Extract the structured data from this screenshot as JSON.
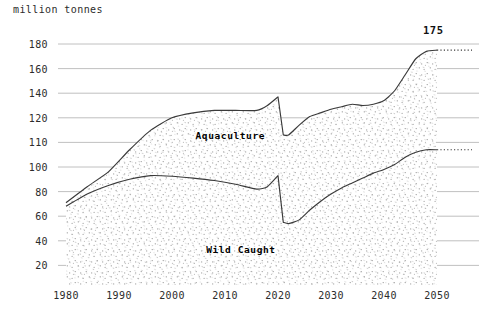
{
  "axis_unit_label": "million tonnes",
  "peak_annotation": "175",
  "series_labels": {
    "aquaculture": "Aquaculture",
    "wild_caught": "Wild Caught"
  },
  "colors": {
    "line": "#3a3a3a",
    "gridline": "#b9b9b9",
    "stipple": "#8d8d8d",
    "text": "#2b2b2b",
    "background": "#ffffff"
  },
  "chart_data": {
    "type": "area",
    "title": "",
    "subtitle": "",
    "xlabel": "",
    "ylabel": "million tonnes",
    "stacked": true,
    "grid": true,
    "legend_position": "inline",
    "annotations": [
      {
        "text": "175",
        "x": 2050,
        "y": 175,
        "note": "projected total production in 2050"
      }
    ],
    "xlim": [
      1978,
      2057
    ],
    "x_ticks": [
      1980,
      1990,
      2000,
      2010,
      2020,
      2030,
      2040,
      2050
    ],
    "x_tick_labels": [
      "1980",
      "1990",
      "2000",
      "2010",
      "2020",
      "2030",
      "2040",
      "2050"
    ],
    "ylim": [
      0,
      190
    ],
    "y_ticks": [
      20,
      40,
      60,
      80,
      100,
      110,
      120,
      140,
      160,
      180
    ],
    "y_tick_labels": [
      "20",
      "40",
      "60",
      "80",
      "100",
      "110",
      "120",
      "140",
      "160",
      "180"
    ],
    "y_scale_note": "non-uniform axis: ticks are evenly spaced in pixels though 100-110-120 step by 10 while others step by 20",
    "x": [
      1980,
      1984,
      1988,
      1992,
      1996,
      2000,
      2004,
      2008,
      2012,
      2016,
      2018,
      2020,
      2021,
      2022,
      2024,
      2026,
      2028,
      2030,
      2032,
      2034,
      2036,
      2038,
      2040,
      2042,
      2044,
      2046,
      2048,
      2050
    ],
    "series": [
      {
        "name": "Wild Caught",
        "values": [
          68,
          78,
          85,
          90,
          93,
          92.5,
          91,
          89,
          86,
          82,
          84,
          93,
          55,
          54,
          57,
          65,
          72,
          78,
          83,
          87,
          91,
          95,
          98,
          101,
          104,
          106,
          107,
          107
        ],
        "fill": "stipple",
        "label_position": {
          "x": 2013,
          "y": 33
        }
      },
      {
        "name": "Aquaculture",
        "values": [
          3,
          6,
          11,
          17,
          22,
          29,
          34,
          38,
          41,
          44,
          47,
          44,
          58,
          59,
          61,
          60,
          59,
          58,
          59,
          61,
          59,
          59,
          65,
          80,
          95,
          105,
          110,
          111
        ],
        "fill": "stipple",
        "label_position": {
          "x": 2011,
          "y": 113
        },
        "note": "values are the band thickness above Wild Caught in the stacked view"
      }
    ],
    "total_line": {
      "name": "Total production",
      "values": [
        71,
        84,
        96,
        107,
        115,
        121.5,
        125,
        127,
        127,
        126,
        131,
        137,
        113,
        113,
        118,
        125,
        131,
        136,
        142,
        148,
        150,
        154,
        163,
        181,
        199,
        211,
        217,
        218
      ],
      "note": "upper boundary of the stacked areas, read on the non-uniform axis as: 71, 84, 96, 107, 115, 120, 124, 126, 126, 126, 130, 137, 113, 113, 117, 121, 124, 127, 129, 131, 130, 131, 134, 142, 155, 168, 174, 175"
    },
    "projection_dotted": {
      "from_x": 2050,
      "to_x": 2057,
      "total_value": 175,
      "wild_caught_value": 107,
      "note": "both boundaries continue flat as dotted lines past 2050"
    }
  }
}
